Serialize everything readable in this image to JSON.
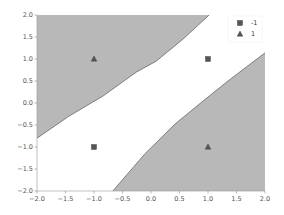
{
  "chart_data": {
    "type": "scatter",
    "title": "",
    "xlabel": "",
    "ylabel": "",
    "xlim": [
      -2.0,
      2.0
    ],
    "ylim": [
      -2.0,
      2.0
    ],
    "grid": false,
    "legend_position": "upper right",
    "x_ticks": [
      -2.0,
      -1.5,
      -1.0,
      -0.5,
      0.0,
      0.5,
      1.0,
      1.5,
      2.0
    ],
    "x_tick_labels": [
      "−2.0",
      "−1.5",
      "−1.0",
      "−0.5",
      "0.0",
      "0.5",
      "1.0",
      "1.5",
      "2.0"
    ],
    "y_ticks": [
      2.0,
      1.5,
      1.0,
      0.5,
      0.0,
      -0.5,
      -1.0,
      -1.5,
      -2.0
    ],
    "y_tick_labels": [
      "2.0",
      "1.5",
      "1.0",
      "0.5",
      "0.0",
      "−0.5",
      "−1.0",
      "−1.5",
      "−2.0"
    ],
    "series": [
      {
        "name": "-1",
        "marker": "square",
        "color": "#555555",
        "points": [
          [
            1.0,
            1.0
          ],
          [
            -1.0,
            -1.0
          ]
        ]
      },
      {
        "name": "1",
        "marker": "triangle",
        "color": "#555555",
        "points": [
          [
            -1.0,
            1.0
          ],
          [
            1.0,
            -1.0
          ]
        ]
      }
    ],
    "decision_regions": [
      {
        "label": "upper-left region (class 1)",
        "fill": "#b8b8b8",
        "boundary": [
          [
            -2.0,
            -0.8
          ],
          [
            -1.44,
            -0.3
          ],
          [
            -0.84,
            0.16
          ],
          [
            -0.26,
            0.7
          ],
          [
            0.09,
            0.95
          ],
          [
            0.56,
            1.45
          ],
          [
            1.02,
            2.0
          ]
        ]
      },
      {
        "label": "lower-right region (class 1)",
        "fill": "#b8b8b8",
        "boundary": [
          [
            -0.67,
            -2.0
          ],
          [
            -0.11,
            -1.16
          ],
          [
            0.42,
            -0.48
          ],
          [
            0.89,
            0.02
          ],
          [
            1.35,
            0.5
          ],
          [
            2.0,
            1.14
          ]
        ]
      }
    ],
    "legend": [
      {
        "marker": "square",
        "label": "-1"
      },
      {
        "marker": "triangle",
        "label": "1"
      }
    ]
  }
}
